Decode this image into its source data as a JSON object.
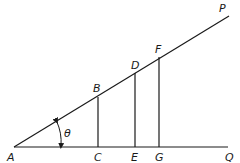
{
  "figure": {
    "type": "geometry-diagram",
    "angle_label": "θ",
    "points": {
      "A": {
        "label": "A",
        "x": 14,
        "y": 147
      },
      "B": {
        "label": "B",
        "x": 98,
        "y": 97
      },
      "C": {
        "label": "C",
        "x": 98,
        "y": 147
      },
      "D": {
        "label": "D",
        "x": 135,
        "y": 73
      },
      "E": {
        "label": "E",
        "x": 135,
        "y": 147
      },
      "F": {
        "label": "F",
        "x": 159,
        "y": 57
      },
      "G": {
        "label": "G",
        "x": 159,
        "y": 147
      },
      "P": {
        "label": "P",
        "x": 229,
        "y": 16
      },
      "Q": {
        "label": "Q",
        "x": 228,
        "y": 147
      }
    },
    "segments": [
      "AP",
      "AQ",
      "BC",
      "DE",
      "FG"
    ],
    "colors": {
      "stroke": "#1a1a1a",
      "background": "#ffffff"
    }
  }
}
